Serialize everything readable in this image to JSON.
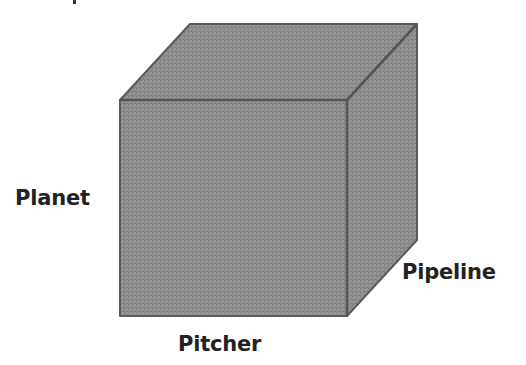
{
  "diagram": {
    "type": "3d-cube",
    "labels": {
      "left": "Planet",
      "right": "Pipeline",
      "bottom": "Pitcher"
    },
    "colors": {
      "face_front": "#8c8c8c",
      "face_top": "#8f8f8f",
      "face_right": "#8a8a8a",
      "edge": "#5a5a5a",
      "label_text": "#222222",
      "background": "#ffffff"
    }
  }
}
